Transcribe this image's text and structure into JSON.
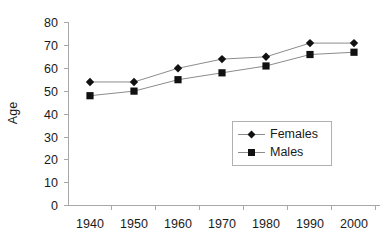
{
  "chart_data": {
    "type": "line",
    "title": "",
    "xlabel": "",
    "ylabel": "Age",
    "categories": [
      "1940",
      "1950",
      "1960",
      "1970",
      "1980",
      "1990",
      "2000"
    ],
    "x": [
      1940,
      1950,
      1960,
      1970,
      1980,
      1990,
      2000
    ],
    "series": [
      {
        "name": "Females",
        "marker": "diamond",
        "color": "#111111",
        "values": [
          54,
          54,
          60,
          64,
          65,
          71,
          71
        ]
      },
      {
        "name": "Males",
        "marker": "square",
        "color": "#111111",
        "values": [
          48,
          50,
          55,
          58,
          61,
          66,
          67
        ]
      }
    ],
    "ylim": [
      0,
      80
    ],
    "y_ticks": [
      0,
      10,
      20,
      30,
      40,
      50,
      60,
      70,
      80
    ],
    "y_tick_labels": [
      "0",
      "10",
      "20",
      "30",
      "40",
      "50",
      "60",
      "70",
      "80"
    ],
    "grid": false,
    "legend_position": "center-right-inside"
  },
  "axes": {
    "y_title": "Age",
    "y_tick_labels": [
      "80",
      "70",
      "60",
      "50",
      "40",
      "30",
      "20",
      "10",
      "0"
    ],
    "x_tick_labels": [
      "1940",
      "1950",
      "1960",
      "1970",
      "1980",
      "1990",
      "2000"
    ]
  },
  "legend": {
    "entries": [
      {
        "label": "Females"
      },
      {
        "label": "Males"
      }
    ]
  },
  "colors": {
    "marker": "#111111",
    "line": "#8c8c8c",
    "axis": "#a8a8a8",
    "text": "#1a1a1a",
    "background": "#ffffff"
  }
}
